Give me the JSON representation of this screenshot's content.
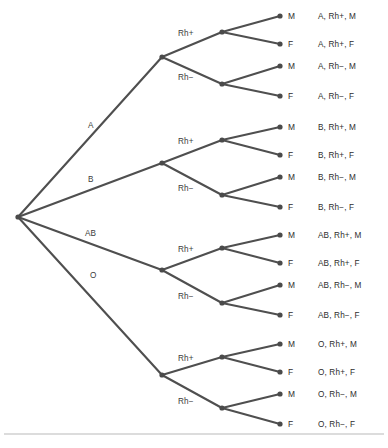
{
  "figure": {
    "kind": "probability-tree-diagram",
    "line_color": "#4f4f4f",
    "node_color": "#4a4a4a",
    "text_color": "#2e2e2e",
    "background": "#ffffff",
    "rule_color": "#b9b9b9"
  },
  "geometry": {
    "width": 388,
    "height": 448,
    "root": {
      "x": 18,
      "y": 217
    },
    "group_x": 162,
    "rh_x": 222,
    "leaf_x": 280,
    "leaf_text_x": 288,
    "outcome_text_x": 318,
    "rule_y": 434,
    "node_radius": 2.6,
    "leaf_ys": [
      16,
      44,
      66,
      96,
      127,
      155,
      177,
      207,
      235,
      263,
      285,
      315,
      344,
      372,
      394,
      424
    ]
  },
  "tree": {
    "root_label": "",
    "groups": [
      {
        "label": "A",
        "label_x": 88,
        "label_y": 128,
        "node_y": 57,
        "rh": [
          {
            "label": "Rh+",
            "label_x": 178,
            "label_y": 36,
            "node_y": 32,
            "leaves": [
              {
                "label": "M",
                "leaf_index": 0,
                "outcome": "A, Rh+, M"
              },
              {
                "label": "F",
                "leaf_index": 1,
                "outcome": "A, Rh+, F"
              }
            ]
          },
          {
            "label": "Rh−",
            "label_x": 178,
            "label_y": 80,
            "node_y": 84,
            "leaves": [
              {
                "label": "M",
                "leaf_index": 2,
                "outcome": "A, Rh−, M"
              },
              {
                "label": "F",
                "leaf_index": 3,
                "outcome": "A, Rh−, F"
              }
            ]
          }
        ]
      },
      {
        "label": "B",
        "label_x": 88,
        "label_y": 182,
        "node_y": 163,
        "rh": [
          {
            "label": "Rh+",
            "label_x": 178,
            "label_y": 144,
            "node_y": 140,
            "leaves": [
              {
                "label": "M",
                "leaf_index": 4,
                "outcome": "B, Rh+, M"
              },
              {
                "label": "F",
                "leaf_index": 5,
                "outcome": "B, Rh+, F"
              }
            ]
          },
          {
            "label": "Rh−",
            "label_x": 178,
            "label_y": 191,
            "node_y": 195,
            "leaves": [
              {
                "label": "M",
                "leaf_index": 6,
                "outcome": "B, Rh−, M"
              },
              {
                "label": "F",
                "leaf_index": 7,
                "outcome": "B, Rh−, F"
              }
            ]
          }
        ]
      },
      {
        "label": "AB",
        "label_x": 85,
        "label_y": 236,
        "node_y": 270,
        "rh": [
          {
            "label": "Rh+",
            "label_x": 178,
            "label_y": 252,
            "node_y": 248,
            "leaves": [
              {
                "label": "M",
                "leaf_index": 8,
                "outcome": "AB, Rh+, M"
              },
              {
                "label": "F",
                "leaf_index": 9,
                "outcome": "AB, Rh+, F"
              }
            ]
          },
          {
            "label": "Rh−",
            "label_x": 178,
            "label_y": 299,
            "node_y": 303,
            "leaves": [
              {
                "label": "M",
                "leaf_index": 10,
                "outcome": "AB, Rh−, M"
              },
              {
                "label": "F",
                "leaf_index": 11,
                "outcome": "AB, Rh−, F"
              }
            ]
          }
        ]
      },
      {
        "label": "O",
        "label_x": 90,
        "label_y": 278,
        "node_y": 375,
        "rh": [
          {
            "label": "Rh+",
            "label_x": 178,
            "label_y": 361,
            "node_y": 357,
            "leaves": [
              {
                "label": "M",
                "leaf_index": 12,
                "outcome": "O, Rh+, M"
              },
              {
                "label": "F",
                "leaf_index": 13,
                "outcome": "O, Rh+, F"
              }
            ]
          },
          {
            "label": "Rh−",
            "label_x": 178,
            "label_y": 404,
            "node_y": 408,
            "leaves": [
              {
                "label": "M",
                "leaf_index": 14,
                "outcome": "O, Rh−, M"
              },
              {
                "label": "F",
                "leaf_index": 15,
                "outcome": "O, Rh−, F"
              }
            ]
          }
        ]
      }
    ]
  }
}
